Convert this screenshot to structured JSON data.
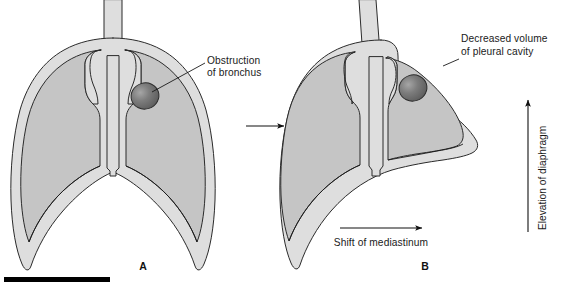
{
  "figure": {
    "panels": [
      {
        "id": "A",
        "caption": "A",
        "description": "Normal thorax with obstruction of bronchus"
      },
      {
        "id": "B",
        "caption": "B",
        "description": "Collapsed lung with mediastinal shift and diaphragm elevation"
      }
    ]
  },
  "annotations": {
    "obstruction": {
      "line1": "Obstruction",
      "line2": "of bronchus"
    },
    "decreased_volume": {
      "line1": "Decreased volume",
      "line2": "of pleural cavity"
    },
    "mediastinum_shift": "Shift of mediastinum",
    "diaphragm_elevation": "Elevation of diaphragm"
  },
  "colors": {
    "background": "#ffffff",
    "pleura_fill": "#dedede",
    "lung_fill": "#c5c5c5",
    "obstruction_fill": "#6f6f6f",
    "obstruction_highlight": "#9a9a9a",
    "outline": "#2b2b2b",
    "text": "#1a1a1a",
    "scale_bar": "#000000"
  },
  "icons": {
    "transition_arrow": "arrow-right-icon",
    "shift_arrow": "arrow-right-icon",
    "elevation_arrow": "arrow-up-icon"
  },
  "scale_bar": {
    "present": true,
    "label": ""
  }
}
